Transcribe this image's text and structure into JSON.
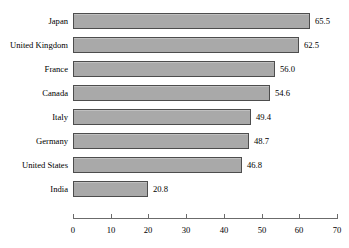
{
  "chart_data": {
    "type": "bar",
    "orientation": "horizontal",
    "title": "",
    "xlabel": "",
    "ylabel": "",
    "categories": [
      "Japan",
      "United Kingdom",
      "France",
      "Canada",
      "Italy",
      "Germany",
      "United States",
      "India"
    ],
    "values": [
      65.5,
      62.5,
      56.0,
      54.6,
      49.4,
      48.7,
      46.8,
      20.8
    ],
    "value_labels": [
      "65.5",
      "62.5",
      "56.0",
      "54.6",
      "49.4",
      "48.7",
      "46.8",
      "20.8"
    ],
    "xlim": [
      0,
      70
    ],
    "xticks": [
      0,
      10,
      20,
      30,
      40,
      50,
      60,
      70
    ],
    "xtick_labels": [
      "0",
      "10",
      "20",
      "30",
      "40",
      "50",
      "60",
      "70"
    ],
    "grid": false,
    "legend": null,
    "bar_fill_color": "#a9a9a9",
    "bar_border_color": "#4d4d4d",
    "axis_color": "#6b6b6b",
    "background_color": "#ffffff",
    "text_color": "#000000"
  }
}
